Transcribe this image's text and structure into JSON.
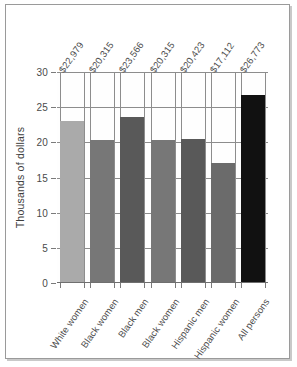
{
  "chart_data": {
    "type": "bar",
    "title": "",
    "xlabel": "",
    "ylabel": "Thousands of dollars",
    "ylim": [
      0,
      30
    ],
    "yticks": [
      0,
      5,
      10,
      15,
      20,
      25,
      30
    ],
    "ytick_labels": [
      "0",
      "5",
      "10",
      "15",
      "20",
      "25",
      "30"
    ],
    "grid": true,
    "legend": "none",
    "units": "thousands of dollars",
    "categories": [
      "White women",
      "Black women",
      "Black men",
      "Black women",
      "Hispanic men",
      "Hispanic women",
      "All persons"
    ],
    "values": [
      22.979,
      20.315,
      23.566,
      20.315,
      20.423,
      17.112,
      26.773
    ],
    "value_labels": [
      "$22,979",
      "$20,315",
      "$23,566",
      "$20,315",
      "$20,423",
      "$17,112",
      "$26,773"
    ],
    "bar_colors": [
      "#aaaaaa",
      "#777777",
      "#595959",
      "#777777",
      "#595959",
      "#6b6b6b",
      "#111111"
    ],
    "bars": [
      {
        "category": "White women",
        "value": 22.979,
        "label": "$22,979",
        "color": "#aaaaaa"
      },
      {
        "category": "Black women",
        "value": 20.315,
        "label": "$20,315",
        "color": "#777777"
      },
      {
        "category": "Black men",
        "value": 23.566,
        "label": "$23,566",
        "color": "#595959"
      },
      {
        "category": "Black women",
        "value": 20.315,
        "label": "$20,315",
        "color": "#777777"
      },
      {
        "category": "Hispanic men",
        "value": 20.423,
        "label": "$20,423",
        "color": "#595959"
      },
      {
        "category": "Hispanic women",
        "value": 17.112,
        "label": "$17,112",
        "color": "#6b6b6b"
      },
      {
        "category": "All persons",
        "value": 26.773,
        "label": "$26,773",
        "color": "#111111"
      }
    ]
  },
  "colors": {
    "grid": "#8d8d8d",
    "axis": "#6f6f6f",
    "text": "#4a4a4a",
    "frame": "#9a9a9a",
    "background": "#ffffff"
  }
}
